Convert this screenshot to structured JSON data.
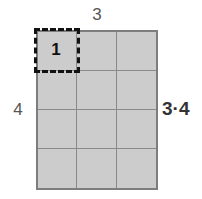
{
  "figure": {
    "type": "area-model-grid",
    "columns": 3,
    "rows": 4,
    "total_cells": 12
  },
  "labels": {
    "top": "3",
    "left": "4",
    "right": "3·4",
    "unit_square": "1"
  },
  "colors": {
    "canvas_background": "#ffffff",
    "cell_fill": "#cccccc",
    "grid_line": "#8a8a8a",
    "grid_outer_border": "#7d7d7d",
    "highlight_border": "#111111",
    "label_text": "#555555",
    "product_text": "#333333",
    "unit_text": "#111111"
  },
  "chart_data": {
    "type": "table",
    "title": "",
    "xlabel": "3",
    "ylabel": "4",
    "annotations": [
      "3",
      "4",
      "3·4",
      "1"
    ],
    "categories": [
      "col-1",
      "col-2",
      "col-3"
    ],
    "values": [
      1,
      1,
      1
    ],
    "series": [
      {
        "name": "row-1",
        "values": [
          1,
          1,
          1
        ]
      },
      {
        "name": "row-2",
        "values": [
          1,
          1,
          1
        ]
      },
      {
        "name": "row-3",
        "values": [
          1,
          1,
          1
        ]
      },
      {
        "name": "row-4",
        "values": [
          1,
          1,
          1
        ]
      }
    ],
    "grid": true,
    "legend": "none"
  }
}
